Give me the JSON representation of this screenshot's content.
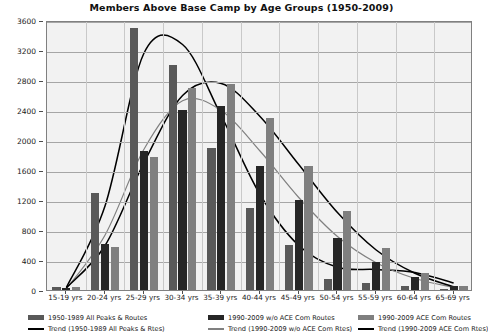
{
  "chart_data": {
    "type": "bar",
    "title": "Members Above Base Camp by Age Groups (1950-2009)",
    "xlabel": "",
    "ylabel": "",
    "ylim": [
      0,
      3600
    ],
    "ytick_step": 400,
    "yticks": [
      "0",
      "400",
      "800",
      "1200",
      "1600",
      "2000",
      "2400",
      "2800",
      "3200",
      "3600"
    ],
    "grid": true,
    "legend_position": "bottom",
    "categories": [
      "15-19 yrs",
      "20-24 yrs",
      "25-29 yrs",
      "30-34 yrs",
      "35-39 yrs",
      "40-44 yrs",
      "45-49 yrs",
      "50-54 yrs",
      "55-59 yrs",
      "60-64 yrs",
      "65-69 yrs"
    ],
    "series": [
      {
        "name": "1950-1989 All Peaks & Routes",
        "color": "#595959",
        "values": [
          40,
          1290,
          3500,
          3000,
          1900,
          1100,
          600,
          150,
          100,
          50,
          15
        ]
      },
      {
        "name": "1990-2009 w/o ACE Com Routes",
        "color": "#262626",
        "values": [
          30,
          610,
          1850,
          2400,
          2450,
          1650,
          1200,
          700,
          370,
          170,
          50
        ]
      },
      {
        "name": "1990-2009 ACE Com Routes",
        "color": "#7f7f7f",
        "values": [
          45,
          580,
          1780,
          2700,
          2750,
          2300,
          1650,
          1050,
          560,
          230,
          60
        ]
      }
    ],
    "trends": [
      {
        "name": "Trend (1950-1989 All Peaks & Rtes)",
        "color": "#000000",
        "values": [
          60,
          1150,
          3180,
          3300,
          2350,
          1300,
          620,
          330,
          300,
          260,
          120
        ]
      },
      {
        "name": "Trend (1990-2009 w/o ACE Com Rtes)",
        "color": "#808080",
        "values": [
          40,
          760,
          1900,
          2550,
          2420,
          1880,
          1260,
          740,
          390,
          180,
          60
        ]
      },
      {
        "name": "Trend (1990-2009 ACE Com Rtes)",
        "color": "#000000",
        "values": [
          55,
          620,
          1720,
          2620,
          2780,
          2340,
          1700,
          1060,
          560,
          250,
          70
        ]
      }
    ]
  },
  "legend": {
    "entries": [
      {
        "bar_label": "1950-1989 All Peaks & Routes",
        "trend_label": "Trend (1950-1989 All Peaks & Rtes)",
        "bar_color": "#595959",
        "trend_color": "#000000"
      },
      {
        "bar_label": "1990-2009 w/o ACE Com Routes",
        "trend_label": "Trend (1990-2009 w/o ACE Com Rtes)",
        "bar_color": "#262626",
        "trend_color": "#808080"
      },
      {
        "bar_label": "1990-2009 ACE Com Routes",
        "trend_label": "Trend (1990-2009 ACE Com Rtes)",
        "bar_color": "#7f7f7f",
        "trend_color": "#000000"
      }
    ]
  }
}
